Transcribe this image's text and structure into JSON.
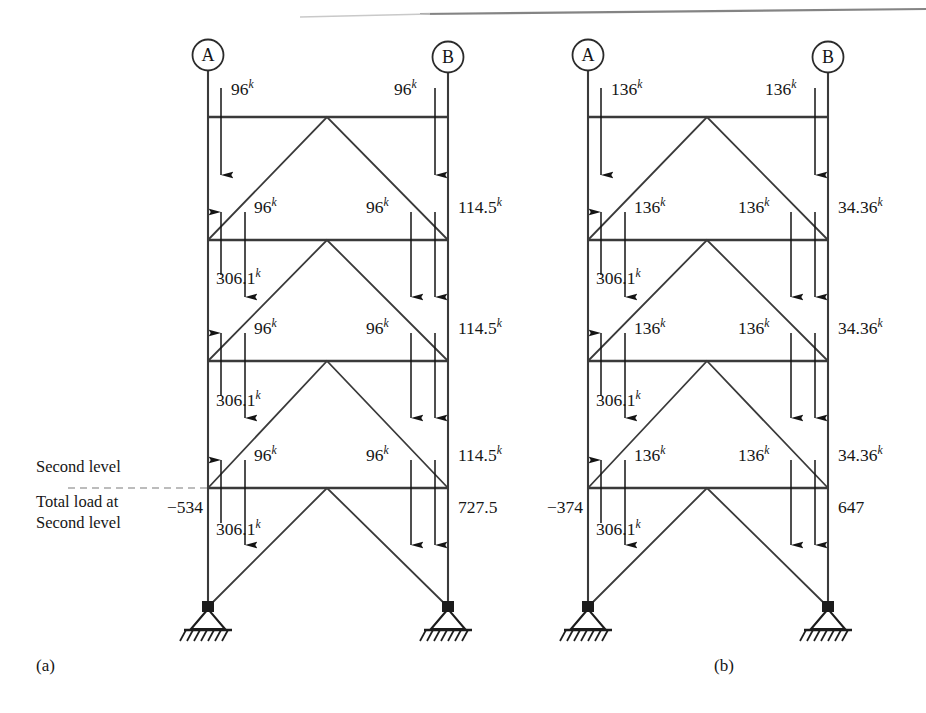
{
  "figure": {
    "top_rule": true,
    "frames": [
      {
        "id": "a",
        "caption": "(a)",
        "joint_labels": {
          "left": "A",
          "right": "B"
        },
        "levels": [
          {
            "name": "roof",
            "left_load": "96",
            "left_load_sup": "k",
            "right_load": "96",
            "right_load_sup": "k"
          },
          {
            "name": "fourth",
            "left_load": "96",
            "left_load_sup": "k",
            "right_load": "96",
            "right_load_sup": "k",
            "column_force": "306.1",
            "column_force_sup": "k",
            "right_shear": "114.5",
            "right_shear_sup": "k"
          },
          {
            "name": "third",
            "left_load": "96",
            "left_load_sup": "k",
            "right_load": "96",
            "right_load_sup": "k",
            "column_force": "306.1",
            "column_force_sup": "k",
            "right_shear": "114.5",
            "right_shear_sup": "k"
          },
          {
            "name": "second",
            "left_load": "96",
            "left_load_sup": "k",
            "right_load": "96",
            "right_load_sup": "k",
            "column_force": "306.1",
            "column_force_sup": "k",
            "right_shear": "114.5",
            "right_shear_sup": "k"
          }
        ],
        "left_total": "−534",
        "right_total": "727.5",
        "annotations": {
          "level_marker": "Second level",
          "total_load_line1": "Total load at",
          "total_load_line2": "Second level"
        }
      },
      {
        "id": "b",
        "caption": "(b)",
        "joint_labels": {
          "left": "A",
          "right": "B"
        },
        "levels": [
          {
            "name": "roof",
            "left_load": "136",
            "left_load_sup": "k",
            "right_load": "136",
            "right_load_sup": "k"
          },
          {
            "name": "fourth",
            "left_load": "136",
            "left_load_sup": "k",
            "right_load": "136",
            "right_load_sup": "k",
            "column_force": "306.1",
            "column_force_sup": "k",
            "right_shear": "34.36",
            "right_shear_sup": "k"
          },
          {
            "name": "third",
            "left_load": "136",
            "left_load_sup": "k",
            "right_load": "136",
            "right_load_sup": "k",
            "column_force": "306.1",
            "column_force_sup": "k",
            "right_shear": "34.36",
            "right_shear_sup": "k"
          },
          {
            "name": "second",
            "left_load": "136",
            "left_load_sup": "k",
            "right_load": "136",
            "right_load_sup": "k",
            "column_force": "306.1",
            "column_force_sup": "k",
            "right_shear": "34.36",
            "right_shear_sup": "k"
          }
        ],
        "left_total": "−374",
        "right_total": "647",
        "annotations": {}
      }
    ]
  },
  "colors": {
    "ink": "#1a1a1a",
    "line": "#333333",
    "dashed": "#9a9a9a",
    "paper": "#ffffff"
  }
}
